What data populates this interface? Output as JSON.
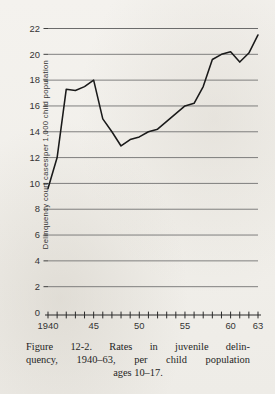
{
  "figure": {
    "caption_line_1": "Figure 12-2. Rates in juvenile delin-",
    "caption_line_2": "quency, 1940–63, per child population",
    "caption_line_3": "ages 10–17.",
    "caption_full": "Figure 12-2. Rates in juvenile delinquency, 1940–63, per child population ages 10–17."
  },
  "colors": {
    "page_background": "#f2f0ec",
    "ink": "#2b2b2b",
    "gridline": "#6b6b6b",
    "data_line": "#1a1a1a",
    "axis": "#2b2b2b"
  },
  "chart_data": {
    "type": "line",
    "title": "",
    "xlabel": "",
    "ylabel": "Delinquency court cases per 1,000 child population",
    "xlim": [
      1940,
      1963
    ],
    "ylim": [
      0,
      22
    ],
    "ytick_step": 2,
    "yticks": [
      0,
      2,
      4,
      6,
      8,
      10,
      12,
      14,
      16,
      18,
      20,
      22
    ],
    "ytick_labels": [
      "0",
      "2",
      "4",
      "6",
      "8",
      "10",
      "12",
      "14",
      "16",
      "18",
      "20",
      "22"
    ],
    "gridlines": [
      2,
      4,
      6,
      8,
      10,
      12,
      14,
      16,
      18,
      20,
      22
    ],
    "grid": true,
    "legend": "none",
    "xticks_all": [
      1940,
      1941,
      1942,
      1943,
      1944,
      1945,
      1946,
      1947,
      1948,
      1949,
      1950,
      1951,
      1952,
      1953,
      1954,
      1955,
      1956,
      1957,
      1958,
      1959,
      1960,
      1961,
      1962,
      1963
    ],
    "xtick_labeled": [
      {
        "year": 1940,
        "label": "1940"
      },
      {
        "year": 1945,
        "label": "45"
      },
      {
        "year": 1950,
        "label": "50"
      },
      {
        "year": 1955,
        "label": "55"
      },
      {
        "year": 1960,
        "label": "60"
      },
      {
        "year": 1963,
        "label": "63"
      }
    ],
    "x": [
      1940,
      1941,
      1942,
      1943,
      1944,
      1945,
      1946,
      1947,
      1948,
      1949,
      1950,
      1951,
      1952,
      1953,
      1954,
      1955,
      1956,
      1957,
      1958,
      1959,
      1960,
      1961,
      1962,
      1963
    ],
    "values": [
      9.6,
      12.0,
      17.3,
      17.2,
      17.5,
      18.0,
      15.0,
      14.0,
      12.9,
      13.4,
      13.6,
      14.0,
      14.2,
      14.8,
      15.4,
      16.0,
      16.2,
      17.5,
      19.6,
      20.0,
      20.2,
      19.4,
      20.1,
      21.5
    ],
    "series": [
      {
        "name": "Delinquency court case rate",
        "values": [
          9.6,
          12.0,
          17.3,
          17.2,
          17.5,
          18.0,
          15.0,
          14.0,
          12.9,
          13.4,
          13.6,
          14.0,
          14.2,
          14.8,
          15.4,
          16.0,
          16.2,
          17.5,
          19.6,
          20.0,
          20.2,
          19.4,
          20.1,
          21.5
        ]
      }
    ]
  }
}
